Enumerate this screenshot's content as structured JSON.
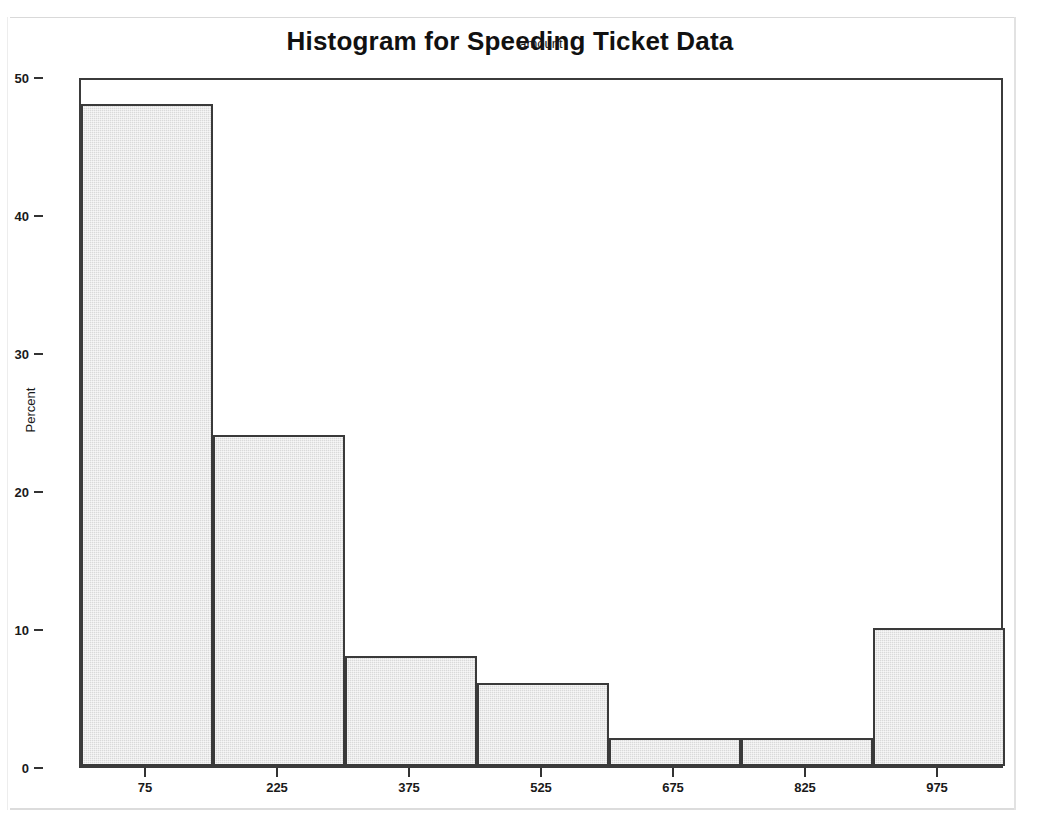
{
  "chart_data": {
    "type": "bar",
    "title": "Histogram for Speeding Ticket Data",
    "xlabel": "amount",
    "ylabel": "Percent",
    "categories": [
      "75",
      "225",
      "375",
      "525",
      "675",
      "825",
      "975"
    ],
    "values": [
      48,
      24,
      8,
      6,
      2,
      2,
      10
    ],
    "bin_width": 150,
    "bin_edges": [
      0,
      150,
      300,
      450,
      600,
      750,
      900,
      1050
    ],
    "xlim": [
      0,
      1050
    ],
    "ylim": [
      0,
      50
    ],
    "ytick_labels": [
      "0",
      "10",
      "20",
      "30",
      "40",
      "50"
    ],
    "ytick_values": [
      0,
      10,
      20,
      30,
      40,
      50
    ],
    "xtick_labels": [
      "75",
      "225",
      "375",
      "525",
      "675",
      "825",
      "975"
    ],
    "xtick_values": [
      75,
      225,
      375,
      525,
      675,
      825,
      975
    ],
    "grid": false,
    "legend": false,
    "bar_fill_color": "#d9d9d9",
    "bar_border_color": "#3a3a3a",
    "frame_color": "#3b3b3b",
    "text_color": "#1a1a1a",
    "background_color": "#ffffff"
  }
}
